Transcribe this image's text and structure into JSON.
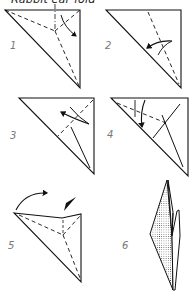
{
  "title": "Rabbit ear fold",
  "colors": {
    "line": "#111111",
    "label": "#777777",
    "background": "#ffffff"
  },
  "steps": [
    {
      "number": "1",
      "description": "Square folded diagonally; valley-fold dashed lines meeting at center point; arrow indicates fold direction"
    },
    {
      "number": "2",
      "description": "Triangle with one dashed fold line; curved arrow folding edge to diagonal"
    },
    {
      "number": "3",
      "description": "Triangle with dashed fold line and curved arrow"
    },
    {
      "number": "4",
      "description": "Triangle with dashed line and downward arrow; crease lines shown"
    },
    {
      "number": "5",
      "description": "Flap being folded over with curved arrow; push arrow indicating squash"
    },
    {
      "number": "6",
      "description": "Finished rabbit ear with shaded (dotted) back flap"
    }
  ]
}
